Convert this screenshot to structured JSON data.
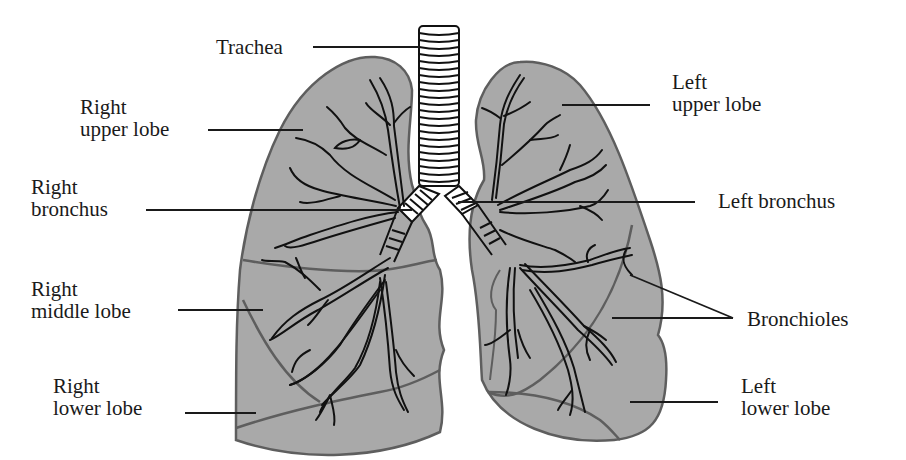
{
  "diagram": {
    "type": "anatomy",
    "colors": {
      "background": "#ffffff",
      "lung_fill": "#a9a9a9",
      "lung_outline": "#5e5e5e",
      "airway_stroke": "#111111",
      "airway_fill_trachea": "#ffffff",
      "leader_line": "#1a1a1a"
    },
    "labels": {
      "trachea": {
        "line1": "Trachea"
      },
      "right_upper_lobe": {
        "line1": "Right",
        "line2": "upper lobe"
      },
      "right_bronchus": {
        "line1": "Right",
        "line2": "bronchus"
      },
      "right_middle_lobe": {
        "line1": "Right",
        "line2": "middle lobe"
      },
      "right_lower_lobe": {
        "line1": "Right",
        "line2": "lower lobe"
      },
      "left_upper_lobe": {
        "line1": "Left",
        "line2": "upper lobe"
      },
      "left_bronchus": {
        "line1": "Left bronchus"
      },
      "bronchioles": {
        "line1": "Bronchioles"
      },
      "left_lower_lobe": {
        "line1": "Left",
        "line2": "lower lobe"
      }
    }
  }
}
